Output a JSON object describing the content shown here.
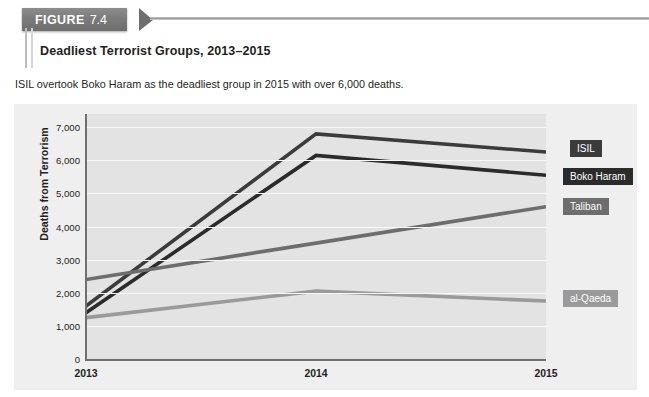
{
  "figure": {
    "label_word": "FIGURE",
    "label_number": "7.4",
    "title": "Deadliest Terrorist Groups, 2013–2015",
    "subtitle": "ISIL overtook Boko Haram as the deadliest group in 2015 with over 6,000 deaths."
  },
  "chart_data": {
    "type": "line",
    "title": "Deadliest Terrorist Groups, 2013–2015",
    "subtitle": "ISIL overtook Boko Haram as the deadliest group in 2015 with over 6,000 deaths.",
    "xlabel": "",
    "ylabel": "Deaths from Terrorism",
    "categories": [
      "2013",
      "2014",
      "2015"
    ],
    "x_tick_labels": [
      "2013",
      "2014",
      "2015"
    ],
    "y_tick_labels": [
      "0",
      "1,000",
      "2,000",
      "3,000",
      "4,000",
      "5,000",
      "6,000",
      "7,000"
    ],
    "y_ticks": [
      0,
      1000,
      2000,
      3000,
      4000,
      5000,
      6000,
      7000
    ],
    "ylim": [
      0,
      7400
    ],
    "grid": "horizontal",
    "legend_position": "right-inline-labels",
    "series": [
      {
        "name": "ISIL",
        "values": [
          1600,
          6800,
          6250
        ],
        "color": "#3b3b3b",
        "label_top": 36,
        "label_left": 556
      },
      {
        "name": "Boko Haram",
        "values": [
          1400,
          6150,
          5550
        ],
        "color": "#2b2b2b",
        "label_top": 64,
        "label_left": 549
      },
      {
        "name": "Taliban",
        "values": [
          2400,
          3500,
          4600
        ],
        "color": "#6d6d6d",
        "label_top": 94,
        "label_left": 549
      },
      {
        "name": "al-Qaeda",
        "values": [
          1250,
          2050,
          1750
        ],
        "color": "#9a9a9a",
        "label_top": 186,
        "label_left": 549
      }
    ]
  }
}
